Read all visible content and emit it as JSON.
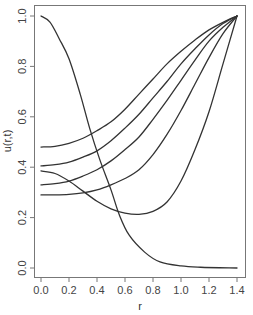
{
  "chart_data": {
    "type": "line",
    "title": "",
    "xlabel": "r",
    "ylabel": "u(r,t)",
    "xlim": [
      0.0,
      1.4
    ],
    "ylim": [
      0.0,
      1.0
    ],
    "grid": false,
    "legend": null,
    "x_ticks": [
      "0.0",
      "0.2",
      "0.4",
      "0.6",
      "0.8",
      "1.0",
      "1.2",
      "1.4"
    ],
    "y_ticks": [
      "0.0",
      "0.2",
      "0.4",
      "0.6",
      "0.8",
      "1.0"
    ],
    "series": [
      {
        "name": "curve-decay",
        "points": [
          [
            0.0,
            1.0
          ],
          [
            0.064,
            0.976
          ],
          [
            0.13,
            0.91
          ],
          [
            0.2,
            0.83
          ],
          [
            0.28,
            0.69
          ],
          [
            0.35,
            0.55
          ],
          [
            0.42,
            0.43
          ],
          [
            0.5,
            0.31
          ],
          [
            0.56,
            0.21
          ],
          [
            0.63,
            0.13
          ],
          [
            0.74,
            0.063
          ],
          [
            0.85,
            0.024
          ],
          [
            1.0,
            0.008
          ],
          [
            1.14,
            0.003
          ],
          [
            1.4,
            0.0
          ]
        ]
      },
      {
        "name": "curve-start-0.48",
        "points": [
          [
            0.0,
            0.48
          ],
          [
            0.1,
            0.483
          ],
          [
            0.2,
            0.495
          ],
          [
            0.3,
            0.515
          ],
          [
            0.4,
            0.545
          ],
          [
            0.5,
            0.58
          ],
          [
            0.6,
            0.63
          ],
          [
            0.7,
            0.69
          ],
          [
            0.8,
            0.75
          ],
          [
            0.9,
            0.81
          ],
          [
            1.0,
            0.86
          ],
          [
            1.1,
            0.905
          ],
          [
            1.2,
            0.945
          ],
          [
            1.3,
            0.975
          ],
          [
            1.4,
            1.0
          ]
        ]
      },
      {
        "name": "curve-start-0.405",
        "points": [
          [
            0.0,
            0.405
          ],
          [
            0.1,
            0.41
          ],
          [
            0.2,
            0.42
          ],
          [
            0.3,
            0.44
          ],
          [
            0.4,
            0.465
          ],
          [
            0.5,
            0.505
          ],
          [
            0.6,
            0.555
          ],
          [
            0.7,
            0.61
          ],
          [
            0.8,
            0.675
          ],
          [
            0.9,
            0.74
          ],
          [
            1.0,
            0.81
          ],
          [
            1.1,
            0.87
          ],
          [
            1.2,
            0.925
          ],
          [
            1.3,
            0.97
          ],
          [
            1.4,
            1.0
          ]
        ]
      },
      {
        "name": "curve-start-0.33",
        "points": [
          [
            0.0,
            0.33
          ],
          [
            0.1,
            0.335
          ],
          [
            0.2,
            0.345
          ],
          [
            0.3,
            0.365
          ],
          [
            0.4,
            0.39
          ],
          [
            0.5,
            0.425
          ],
          [
            0.6,
            0.47
          ],
          [
            0.7,
            0.52
          ],
          [
            0.8,
            0.59
          ],
          [
            0.9,
            0.665
          ],
          [
            1.0,
            0.745
          ],
          [
            1.1,
            0.825
          ],
          [
            1.2,
            0.9
          ],
          [
            1.3,
            0.955
          ],
          [
            1.4,
            1.0
          ]
        ]
      },
      {
        "name": "curve-start-0.29",
        "points": [
          [
            0.0,
            0.29
          ],
          [
            0.1,
            0.29
          ],
          [
            0.2,
            0.292
          ],
          [
            0.3,
            0.298
          ],
          [
            0.4,
            0.31
          ],
          [
            0.5,
            0.33
          ],
          [
            0.6,
            0.355
          ],
          [
            0.7,
            0.39
          ],
          [
            0.8,
            0.45
          ],
          [
            0.9,
            0.53
          ],
          [
            1.0,
            0.625
          ],
          [
            1.1,
            0.73
          ],
          [
            1.2,
            0.835
          ],
          [
            1.3,
            0.93
          ],
          [
            1.4,
            1.0
          ]
        ]
      },
      {
        "name": "curve-dip-start-0.385",
        "points": [
          [
            0.0,
            0.385
          ],
          [
            0.1,
            0.375
          ],
          [
            0.2,
            0.345
          ],
          [
            0.3,
            0.305
          ],
          [
            0.4,
            0.265
          ],
          [
            0.5,
            0.235
          ],
          [
            0.6,
            0.218
          ],
          [
            0.7,
            0.213
          ],
          [
            0.8,
            0.225
          ],
          [
            0.9,
            0.262
          ],
          [
            1.0,
            0.345
          ],
          [
            1.1,
            0.47
          ],
          [
            1.2,
            0.62
          ],
          [
            1.3,
            0.81
          ],
          [
            1.4,
            1.0
          ]
        ]
      }
    ],
    "annotations": []
  }
}
